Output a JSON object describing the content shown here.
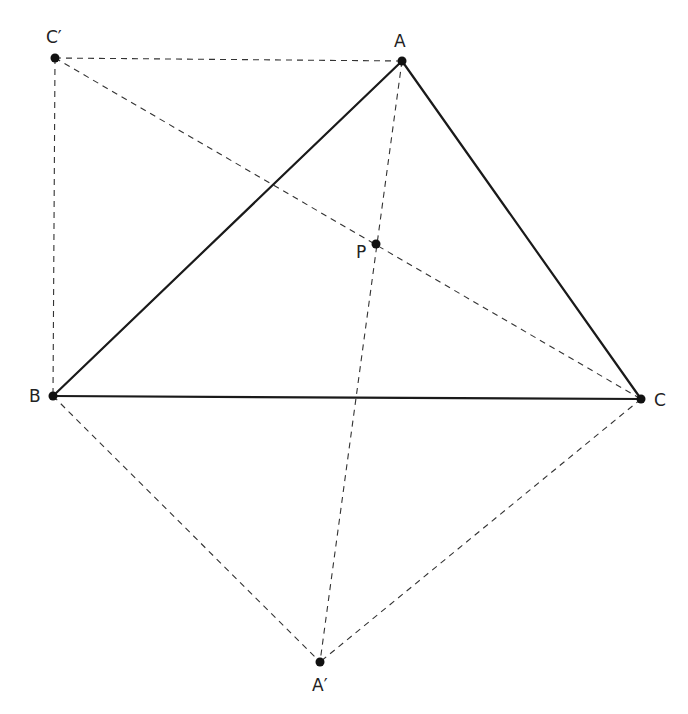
{
  "diagram": {
    "points": {
      "A": {
        "label": "A",
        "x": 402,
        "y": 61,
        "lx": 394,
        "ly": 47
      },
      "B": {
        "label": "B",
        "x": 53,
        "y": 396,
        "lx": 29,
        "ly": 402
      },
      "C": {
        "label": "C",
        "x": 641,
        "y": 399,
        "lx": 654,
        "ly": 406
      },
      "P": {
        "label": "P",
        "x": 376,
        "y": 244,
        "lx": 356,
        "ly": 258
      },
      "Cp": {
        "label": "C′",
        "x": 55,
        "y": 58,
        "lx": 46,
        "ly": 43
      },
      "Ap": {
        "label": "A′",
        "x": 320,
        "y": 662,
        "lx": 312,
        "ly": 691
      }
    },
    "solid_segments": [
      [
        "A",
        "B"
      ],
      [
        "B",
        "C"
      ],
      [
        "C",
        "A"
      ]
    ],
    "dashed_segments": [
      [
        "Cp",
        "A"
      ],
      [
        "Cp",
        "B"
      ],
      [
        "Cp",
        "C"
      ],
      [
        "A",
        "Ap"
      ],
      [
        "B",
        "Ap"
      ],
      [
        "C",
        "Ap"
      ]
    ],
    "colors": {
      "line": "#1a1a1a",
      "dashed": "#333333",
      "point": "#111111",
      "background": "#ffffff"
    }
  }
}
